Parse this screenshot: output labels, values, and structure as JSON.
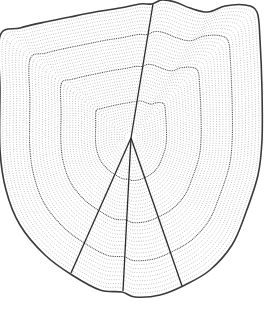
{
  "figure": {
    "colors": {
      "background": "#ffffff",
      "outline": "#3a3a3a",
      "rings": "#8a8a8a",
      "annuli": "#555555",
      "radii": "#2a2a2a"
    },
    "focus": {
      "x": 131,
      "y": 138
    },
    "outline_points": [
      [
        0,
        36
      ],
      [
        20,
        28
      ],
      [
        45,
        22
      ],
      [
        70,
        17
      ],
      [
        95,
        12
      ],
      [
        120,
        8
      ],
      [
        140,
        4
      ],
      [
        152,
        4
      ],
      [
        162,
        0
      ],
      [
        175,
        2
      ],
      [
        190,
        8
      ],
      [
        208,
        12
      ],
      [
        225,
        6
      ],
      [
        245,
        5
      ],
      [
        257,
        12
      ],
      [
        260,
        40
      ],
      [
        262,
        90
      ],
      [
        262,
        140
      ],
      [
        258,
        175
      ],
      [
        245,
        215
      ],
      [
        232,
        245
      ],
      [
        210,
        270
      ],
      [
        185,
        285
      ],
      [
        160,
        295
      ],
      [
        135,
        297
      ],
      [
        122,
        292
      ],
      [
        100,
        290
      ],
      [
        72,
        275
      ],
      [
        45,
        255
      ],
      [
        20,
        225
      ],
      [
        6,
        190
      ],
      [
        0,
        150
      ],
      [
        0,
        90
      ]
    ],
    "radii": [
      {
        "from": [
          131,
          138
        ],
        "to": [
          153,
          4
        ]
      },
      {
        "from": [
          131,
          138
        ],
        "to": [
          71,
          273
        ]
      },
      {
        "from": [
          131,
          138
        ],
        "to": [
          123,
          291
        ]
      },
      {
        "from": [
          131,
          138
        ],
        "to": [
          182,
          286
        ]
      }
    ],
    "ring_count": 42,
    "annuli_rings": [
      12,
      24,
      34
    ]
  }
}
